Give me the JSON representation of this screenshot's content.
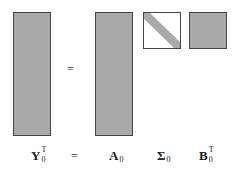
{
  "diagram": {
    "type": "matrix-decomposition",
    "operator": "=",
    "matrices": [
      {
        "id": "Y",
        "symbol": "Y",
        "superscript": "T",
        "subscript": "0",
        "shape": "tall",
        "fill": "#a9a9a9"
      },
      {
        "id": "A",
        "symbol": "A",
        "superscript": "",
        "subscript": "0",
        "shape": "tall",
        "fill": "#a9a9a9"
      },
      {
        "id": "Sigma",
        "symbol": "Σ",
        "superscript": "",
        "subscript": "0",
        "shape": "square-diagonal",
        "fill": "#ffffff",
        "diagonal_fill": "#a9a9a9"
      },
      {
        "id": "B",
        "symbol": "B",
        "superscript": "T",
        "subscript": "0",
        "shape": "square",
        "fill": "#a9a9a9"
      }
    ],
    "equals_sign": "=",
    "label_equals_sign": "="
  }
}
